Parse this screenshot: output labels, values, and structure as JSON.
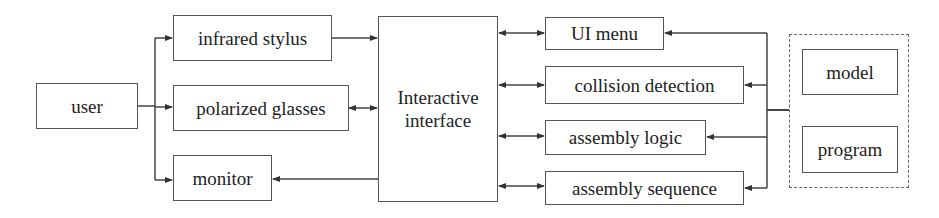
{
  "diagram": {
    "type": "block-diagram",
    "nodes": {
      "user": "user",
      "infrared_stylus": "infrared stylus",
      "polarized_glasses": "polarized glasses",
      "monitor": "monitor",
      "interactive_interface": "Interactive interface",
      "ui_menu": "UI menu",
      "collision_detection": "collision detection",
      "assembly_logic": "assembly logic",
      "assembly_sequence": "assembly sequence",
      "model": "model",
      "program": "program"
    },
    "group": {
      "name": "resources",
      "members": [
        "model",
        "program"
      ],
      "style": "dashed"
    },
    "edges": [
      {
        "from": "user",
        "to": "infrared_stylus",
        "direction": "forward"
      },
      {
        "from": "user",
        "to": "polarized_glasses",
        "direction": "forward"
      },
      {
        "from": "user",
        "to": "monitor",
        "direction": "forward"
      },
      {
        "from": "infrared_stylus",
        "to": "interactive_interface",
        "direction": "forward"
      },
      {
        "from": "polarized_glasses",
        "to": "interactive_interface",
        "direction": "both"
      },
      {
        "from": "interactive_interface",
        "to": "monitor",
        "direction": "forward"
      },
      {
        "from": "interactive_interface",
        "to": "ui_menu",
        "direction": "both"
      },
      {
        "from": "interactive_interface",
        "to": "collision_detection",
        "direction": "both"
      },
      {
        "from": "interactive_interface",
        "to": "assembly_logic",
        "direction": "both"
      },
      {
        "from": "interactive_interface",
        "to": "assembly_sequence",
        "direction": "both"
      },
      {
        "from": "resources",
        "to": "ui_menu",
        "direction": "forward"
      },
      {
        "from": "resources",
        "to": "collision_detection",
        "direction": "forward"
      },
      {
        "from": "resources",
        "to": "assembly_logic",
        "direction": "forward"
      },
      {
        "from": "resources",
        "to": "assembly_sequence",
        "direction": "forward"
      }
    ]
  }
}
